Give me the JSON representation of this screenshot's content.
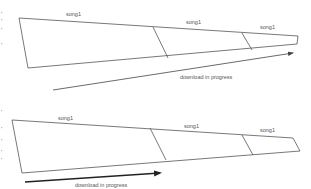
{
  "diagrams": [
    {
      "id": "top",
      "segments": [
        {
          "label": "song1"
        },
        {
          "label": "song1"
        },
        {
          "label": "song1"
        }
      ],
      "arrow": {
        "label": "download in progress",
        "direction": "left-to-right",
        "style": "thin"
      }
    },
    {
      "id": "bottom",
      "segments": [
        {
          "label": "song1"
        },
        {
          "label": "song1"
        },
        {
          "label": "song1"
        }
      ],
      "arrow": {
        "label": "download in progress",
        "direction": "left-to-right",
        "style": "bold"
      }
    }
  ],
  "colors": {
    "line": "#555555",
    "text": "#555555",
    "background": "#ffffff"
  }
}
